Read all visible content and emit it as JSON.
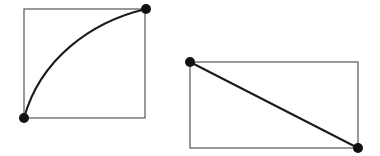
{
  "figures": [
    {
      "name": "square-with-curve",
      "rect": {
        "x": 24,
        "y": 9,
        "w": 121,
        "h": 109
      },
      "path": "M24,118 C40,60 90,22 146,9",
      "points": [
        {
          "x": 24,
          "y": 118
        },
        {
          "x": 146,
          "y": 9
        }
      ]
    },
    {
      "name": "rectangle-with-diagonal",
      "rect": {
        "x": 190,
        "y": 62,
        "w": 168,
        "h": 86
      },
      "path": "M190,62 L358,148",
      "points": [
        {
          "x": 190,
          "y": 62
        },
        {
          "x": 358,
          "y": 148
        }
      ]
    }
  ],
  "colors": {
    "stroke": "#1a1a1a",
    "rect_stroke": "#555555",
    "dot": "#111111",
    "background": "#ffffff"
  }
}
